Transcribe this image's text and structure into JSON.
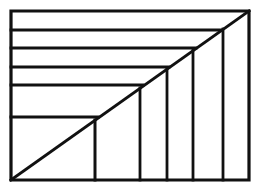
{
  "figure": {
    "type": "line-drawing",
    "background_color": "#ffffff",
    "stroke_color": "#111111",
    "canvas": {
      "width": 254,
      "height": 187
    },
    "border": {
      "label": "outer rectangle",
      "x1": 11,
      "y1": 11,
      "x2": 249,
      "y2": 180,
      "stroke_width": 3.2
    },
    "diagonal": {
      "label": "main diagonal",
      "x1": 11,
      "y1": 180,
      "x2": 249,
      "y2": 11,
      "stroke_width": 3.0
    },
    "horizontal_lines": [
      {
        "label": "horizontal-1",
        "y": 30,
        "x_start": 11,
        "x_end": 221,
        "stroke_width": 2.8
      },
      {
        "label": "horizontal-2",
        "y": 48,
        "x_start": 11,
        "x_end": 196,
        "stroke_width": 2.8
      },
      {
        "label": "horizontal-3",
        "y": 67,
        "x_start": 11,
        "x_end": 169,
        "stroke_width": 2.8
      },
      {
        "label": "horizontal-4",
        "y": 85,
        "x_start": 11,
        "x_end": 143,
        "stroke_width": 2.8
      },
      {
        "label": "horizontal-5",
        "y": 117,
        "x_start": 11,
        "x_end": 98,
        "stroke_width": 3.0
      }
    ],
    "vertical_lines": [
      {
        "label": "vertical-1",
        "x": 95,
        "y_start": 120,
        "y_end": 180,
        "stroke_width": 3.0
      },
      {
        "label": "vertical-2",
        "x": 140,
        "y_start": 88,
        "y_end": 180,
        "stroke_width": 2.8
      },
      {
        "label": "vertical-3",
        "x": 167,
        "y_start": 69,
        "y_end": 180,
        "stroke_width": 2.8
      },
      {
        "label": "vertical-4",
        "x": 193,
        "y_start": 50,
        "y_end": 180,
        "stroke_width": 2.8
      },
      {
        "label": "vertical-5",
        "x": 223,
        "y_start": 29,
        "y_end": 180,
        "stroke_width": 2.8
      }
    ],
    "counts": {
      "horizontal_line_count": 5,
      "vertical_line_count": 5
    }
  }
}
